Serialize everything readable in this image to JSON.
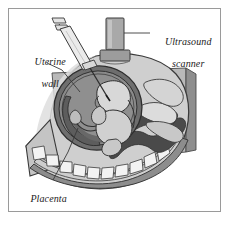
{
  "figure": {
    "frame": {
      "border_color": "#9a9a9a",
      "background": "#ffffff"
    }
  },
  "labels": {
    "ultrasound": {
      "line1": "Ultrasound",
      "line2": "scanner",
      "text": "Ultrasound scanner"
    },
    "uterine": {
      "line1": "Uterine",
      "line2": "wall",
      "text": "Uterine wall"
    },
    "placenta": {
      "line1": "Placenta",
      "text": "Placenta"
    }
  },
  "colors": {
    "outline": "#3a3a3a",
    "skin_light": "#d6d6d6",
    "skin_mid": "#bdbdbd",
    "skin_shadow": "#a8a8a8",
    "cut_plane": "#b4b4b4",
    "cut_edge": "#8e8e8e",
    "muscle_band": "#8a8a8a",
    "uterine_wall": "#6e6e6e",
    "amniotic_fluid": "#7d7d7d",
    "amniotic_dark": "#5f5f5f",
    "fetus": "#d2d2d2",
    "placenta_tone": "#9c9c9c",
    "intestine_dark": "#4a4a4a",
    "spine_white": "#f2f2f2",
    "scanner_body": "#a9a9a9",
    "scanner_base": "#9c9c9c",
    "syringe_barrel": "#e8e8e8",
    "leader_line": "#4a4a4a",
    "label_text": "#1b1b1b"
  },
  "elements": {
    "scanner": "ultrasound-scanner-probe",
    "syringe": "amniocentesis-syringe",
    "needle": "amniocentesis-needle",
    "fetus": "fetus",
    "uterus": "uterus",
    "placenta": "placenta",
    "spine": "maternal-spine",
    "intestines": "maternal-intestines",
    "abdomen": "maternal-abdomen"
  }
}
